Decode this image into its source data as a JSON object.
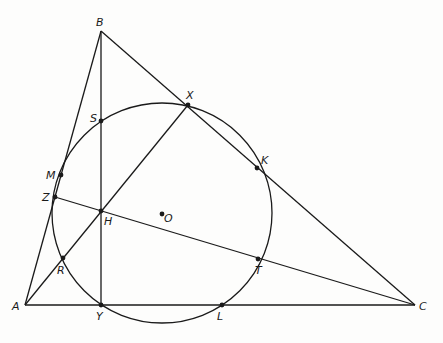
{
  "figure": {
    "width": 443,
    "height": 343,
    "stroke_color": "#1a1a1a",
    "background": "#fdfdfc"
  },
  "circle": {
    "name": "nine-point-circle",
    "cx": 162,
    "cy": 213,
    "r": 110
  },
  "points": [
    {
      "id": "A",
      "label": "A",
      "x": 25,
      "y": 305,
      "dot": false,
      "lx": 12,
      "ly": 310
    },
    {
      "id": "B",
      "label": "B",
      "x": 101,
      "y": 31,
      "dot": false,
      "lx": 96,
      "ly": 26
    },
    {
      "id": "C",
      "label": "C",
      "x": 415,
      "y": 305,
      "dot": false,
      "lx": 419,
      "ly": 310
    },
    {
      "id": "X",
      "label": "X",
      "x": 188,
      "y": 105,
      "dot": true,
      "lx": 186,
      "ly": 99
    },
    {
      "id": "Y",
      "label": "Y",
      "x": 101,
      "y": 305,
      "dot": true,
      "lx": 96,
      "ly": 320
    },
    {
      "id": "Z",
      "label": "Z",
      "x": 55,
      "y": 197,
      "dot": true,
      "lx": 42,
      "ly": 201
    },
    {
      "id": "H",
      "label": "H",
      "x": 101,
      "y": 211,
      "dot": true,
      "lx": 104,
      "ly": 225
    },
    {
      "id": "S",
      "label": "S",
      "x": 101,
      "y": 121,
      "dot": true,
      "lx": 90,
      "ly": 122
    },
    {
      "id": "M",
      "label": "M",
      "x": 61,
      "y": 175,
      "dot": true,
      "lx": 46,
      "ly": 179
    },
    {
      "id": "R",
      "label": "R",
      "x": 63,
      "y": 258,
      "dot": true,
      "lx": 57,
      "ly": 274
    },
    {
      "id": "K",
      "label": "K",
      "x": 257,
      "y": 168,
      "dot": true,
      "lx": 261,
      "ly": 164
    },
    {
      "id": "T",
      "label": "T",
      "x": 258,
      "y": 259,
      "dot": true,
      "lx": 255,
      "ly": 274
    },
    {
      "id": "L",
      "label": "L",
      "x": 222,
      "y": 305,
      "dot": true,
      "lx": 217,
      "ly": 320
    },
    {
      "id": "O",
      "label": "O",
      "x": 162,
      "y": 214,
      "dot": true,
      "lx": 164,
      "ly": 222
    }
  ],
  "segments": [
    {
      "name": "side-AB",
      "from": "A",
      "to": "B"
    },
    {
      "name": "side-BC",
      "from": "B",
      "to": "C"
    },
    {
      "name": "side-AC",
      "from": "A",
      "to": "C"
    },
    {
      "name": "altitude-BY",
      "from": "B",
      "to": "Y"
    },
    {
      "name": "altitude-AX",
      "from": "A",
      "to": "X"
    },
    {
      "name": "altitude-CZ",
      "from": "C",
      "to": "Z"
    }
  ]
}
